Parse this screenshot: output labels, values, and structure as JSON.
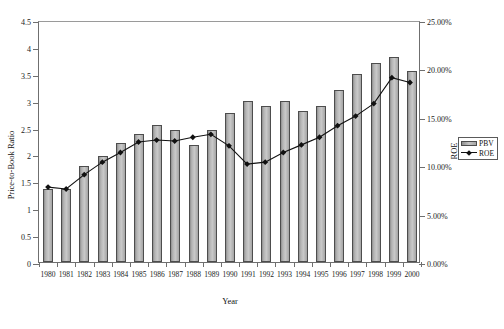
{
  "chart_data": {
    "type": "bar",
    "title": "",
    "xlabel": "Year",
    "ylabel": "Price-to-Book Ratio",
    "y2label": "ROE",
    "categories": [
      "1980",
      "1981",
      "1982",
      "1983",
      "1984",
      "1985",
      "1986",
      "1987",
      "1988",
      "1989",
      "1990",
      "1991",
      "1992",
      "1993",
      "1994",
      "1995",
      "1996",
      "1997",
      "1998",
      "1999",
      "2000"
    ],
    "ylim": [
      0,
      4.5
    ],
    "y2lim": [
      0,
      25
    ],
    "yticks": [
      "0",
      "0.5",
      "1",
      "1.5",
      "2",
      "2.5",
      "3",
      "3.5",
      "4",
      "4.5"
    ],
    "y2ticks": [
      "0.00%",
      "5.00%",
      "10.00%",
      "15.00%",
      "20.00%",
      "25.00%"
    ],
    "grid": false,
    "legend_position": "right",
    "series": [
      {
        "name": "PBV",
        "type": "bar",
        "axis": "left",
        "color": "#c0c0c0",
        "values": [
          1.35,
          1.36,
          1.78,
          1.98,
          2.22,
          2.38,
          2.55,
          2.45,
          2.18,
          2.45,
          2.78,
          3.0,
          2.9,
          3.0,
          2.8,
          2.9,
          3.2,
          3.5,
          3.7,
          3.82,
          3.55
        ]
      },
      {
        "name": "ROE",
        "type": "line",
        "axis": "right",
        "color": "#111111",
        "values": [
          7.8,
          7.6,
          9.1,
          10.4,
          11.4,
          12.5,
          12.7,
          12.6,
          13.0,
          13.3,
          12.1,
          10.2,
          10.4,
          11.4,
          12.2,
          13.0,
          14.2,
          15.2,
          16.5,
          19.2,
          18.7
        ]
      }
    ]
  },
  "legend": {
    "items": [
      {
        "label": "PBV",
        "marker": "bar-swatch"
      },
      {
        "label": "ROE",
        "marker": "line-diamond-swatch"
      }
    ]
  }
}
